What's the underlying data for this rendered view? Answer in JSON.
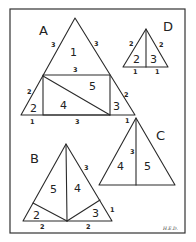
{
  "figure": {
    "signature": "H.E.D.",
    "stroke_color": "#2a2a2a",
    "background": "#ffffff"
  },
  "diagrams": {
    "A": {
      "label": "A",
      "pieces": {
        "p1": "1",
        "p2": "2",
        "p3": "3",
        "p4": "4",
        "p5": "5"
      },
      "lengths": {
        "left_upper": "3",
        "right_upper": "3",
        "rect_top": "3",
        "left_lower": "2",
        "right_lower": "2",
        "base_left": "1",
        "base_mid": "3",
        "base_right": "1"
      }
    },
    "B": {
      "label": "B",
      "pieces": {
        "p5": "5",
        "p4": "4",
        "p2": "2",
        "p3": "3"
      },
      "lengths": {
        "right_upper": "3",
        "right_lower": "1",
        "base_left": "2",
        "base_right": "2"
      }
    },
    "C": {
      "label": "C",
      "pieces": {
        "p4": "4",
        "p5": "5"
      },
      "lengths": {
        "height": "3"
      }
    },
    "D": {
      "label": "D",
      "pieces": {
        "p2": "2",
        "p3": "3"
      },
      "lengths": {
        "left": "2",
        "right": "2",
        "base_left": "1",
        "base_right": "1"
      }
    }
  }
}
